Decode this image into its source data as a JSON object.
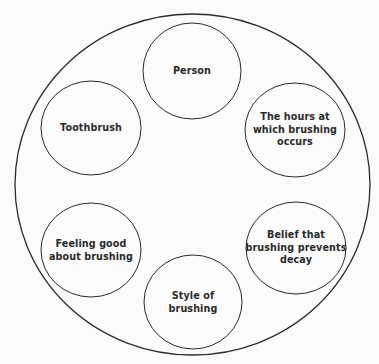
{
  "diagram": {
    "type": "venn-containment",
    "colors": {
      "background": "#fbfbfb",
      "stroke": "#2a2a2a",
      "text": "#2a2a2a"
    },
    "outer": {
      "cx": 192.5,
      "cy": 184.5,
      "rx": 177.5,
      "ry": 170.5
    },
    "nodes": [
      {
        "id": "person",
        "lines": [
          "Person"
        ],
        "cx": 192,
        "cy": 71,
        "rx": 49,
        "ry": 48
      },
      {
        "id": "toothbrush",
        "lines": [
          "Toothbrush"
        ],
        "cx": 91,
        "cy": 128,
        "rx": 50,
        "ry": 47
      },
      {
        "id": "hours",
        "lines": [
          "The hours at",
          "which brushing",
          "occurs"
        ],
        "cx": 295,
        "cy": 130,
        "rx": 50,
        "ry": 47
      },
      {
        "id": "feeling-good",
        "lines": [
          "Feeling good",
          "about brushing"
        ],
        "cx": 91,
        "cy": 250,
        "rx": 50,
        "ry": 47
      },
      {
        "id": "belief",
        "lines": [
          "Belief that",
          "brushing prevents",
          "decay"
        ],
        "cx": 296,
        "cy": 248,
        "rx": 50,
        "ry": 46
      },
      {
        "id": "style",
        "lines": [
          "Style of",
          "brushing"
        ],
        "cx": 193,
        "cy": 302,
        "rx": 49,
        "ry": 47
      }
    ]
  }
}
